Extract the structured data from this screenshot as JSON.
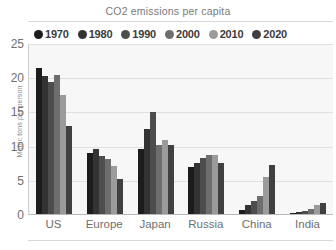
{
  "chart_data": {
    "type": "bar",
    "title": "CO2 emissions per capita",
    "xlabel": "",
    "ylabel": "Metric tons per person",
    "ylim": [
      0,
      25
    ],
    "yticks": [
      0,
      5,
      10,
      15,
      20,
      25
    ],
    "grid": true,
    "legend_position": "top",
    "categories": [
      "US",
      "Europe",
      "Japan",
      "Russia",
      "China",
      "India"
    ],
    "series": [
      {
        "name": "1970",
        "color": "#1c1c1c",
        "values": [
          21.5,
          9.0,
          9.6,
          7.0,
          0.8,
          0.3
        ]
      },
      {
        "name": "1980",
        "color": "#333333",
        "values": [
          20.3,
          9.7,
          12.6,
          7.6,
          1.5,
          0.4
        ]
      },
      {
        "name": "1990",
        "color": "#4d4d4d",
        "values": [
          19.5,
          8.7,
          15.0,
          8.4,
          2.0,
          0.6
        ]
      },
      {
        "name": "2000",
        "color": "#6e6e6e",
        "values": [
          20.5,
          8.2,
          10.3,
          8.8,
          2.8,
          0.9
        ]
      },
      {
        "name": "2010",
        "color": "#9b9b9b",
        "values": [
          17.5,
          7.2,
          10.9,
          8.8,
          5.5,
          1.4
        ]
      },
      {
        "name": "2020",
        "color": "#404040",
        "values": [
          13.0,
          5.3,
          10.3,
          7.6,
          7.3,
          1.8
        ]
      }
    ]
  },
  "legend": {
    "items": [
      {
        "label": "1970"
      },
      {
        "label": "1980"
      },
      {
        "label": "1990"
      },
      {
        "label": "2000"
      },
      {
        "label": "2010"
      },
      {
        "label": "2020"
      }
    ]
  },
  "colors": {
    "plot_background": "#f7f7f7",
    "gridline": "#e0e0e0",
    "axis": "#b9b9b9",
    "text": "#6f6f6f",
    "title_text": "#7a7a7a"
  }
}
